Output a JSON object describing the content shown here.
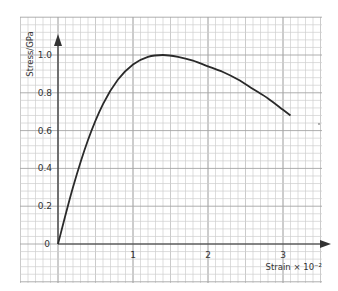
{
  "chart_data": {
    "type": "line",
    "title": "",
    "xlabel": "Strain × 10⁻²",
    "ylabel": "Stress/GPa",
    "x_ticks": [
      "1",
      "2",
      "3"
    ],
    "y_ticks": [
      "0",
      "0.2",
      "0.4",
      "0.6",
      "0.8",
      "1.0"
    ],
    "origin_label": "0",
    "xlim": [
      0,
      3.4
    ],
    "ylim": [
      0,
      1.1
    ],
    "grid": true,
    "legend": null,
    "series": [
      {
        "name": "stress-strain curve",
        "x": [
          0,
          0.2,
          0.4,
          0.6,
          0.8,
          1.0,
          1.2,
          1.4,
          1.6,
          1.8,
          2.0,
          2.2,
          2.4,
          2.6,
          2.8,
          3.0,
          3.1
        ],
        "y": [
          0,
          0.3,
          0.55,
          0.74,
          0.87,
          0.95,
          0.99,
          1.0,
          0.99,
          0.97,
          0.94,
          0.91,
          0.87,
          0.82,
          0.77,
          0.71,
          0.68
        ]
      }
    ]
  }
}
